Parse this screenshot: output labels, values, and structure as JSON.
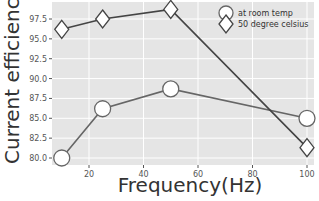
{
  "chart_data": {
    "type": "line",
    "title": "",
    "xlabel": "Frequency(Hz)",
    "ylabel": "Current efficiency(%)",
    "x": [
      10,
      25,
      50,
      100
    ],
    "xticks": [
      20,
      40,
      60,
      80,
      100
    ],
    "yticks": [
      80.0,
      82.5,
      85.0,
      87.5,
      90.0,
      92.5,
      95.0,
      97.5
    ],
    "xlim": [
      6.5,
      102.5
    ],
    "ylim": [
      79.1,
      99.6
    ],
    "grid": true,
    "legend_position": "upper right",
    "series": [
      {
        "name": "at room temp",
        "marker": "circle",
        "values": [
          80.0,
          86.2,
          88.7,
          85.0
        ]
      },
      {
        "name": "50 degree celsius",
        "marker": "diamond",
        "values": [
          96.2,
          97.5,
          98.7,
          81.3
        ]
      }
    ]
  },
  "legend": {
    "items": [
      "at room temp",
      "50 degree celsius"
    ]
  },
  "axes": {
    "xlabel": "Frequency(Hz)",
    "ylabel": "Current efficiency(%)"
  }
}
